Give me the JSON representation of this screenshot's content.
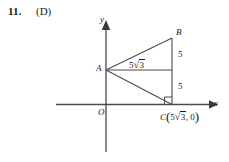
{
  "problem": {
    "number": "11.",
    "choice": "(D)"
  },
  "figure": {
    "type": "geometry-diagram",
    "axes": {
      "x_label": "x",
      "y_label": "y",
      "origin_label": "O"
    },
    "points": [
      {
        "name": "A",
        "label": "A",
        "px": [
          106,
          70
        ]
      },
      {
        "name": "B",
        "label": "B",
        "px": [
          172,
          38
        ]
      },
      {
        "name": "C",
        "label": "C",
        "px": [
          172,
          105
        ],
        "coordinate_text": "C(5√3, 0)"
      }
    ],
    "point_c": {
      "name": "C",
      "open_paren": "(",
      "coeff": "5",
      "radical_sign": "√",
      "radicand": "3",
      "comma_zero": ", 0",
      "close_paren": ")"
    },
    "segment_labels": {
      "bc_upper": "5",
      "bc_lower": "5",
      "ac_horizontal_coeff": "5",
      "ac_horizontal_radical": "√",
      "ac_horizontal_radicand": "3"
    },
    "right_angle_at": "C",
    "colors": {
      "stroke": "#4a4a4a",
      "text": "#1a1a1a",
      "background": "#ffffff"
    }
  }
}
